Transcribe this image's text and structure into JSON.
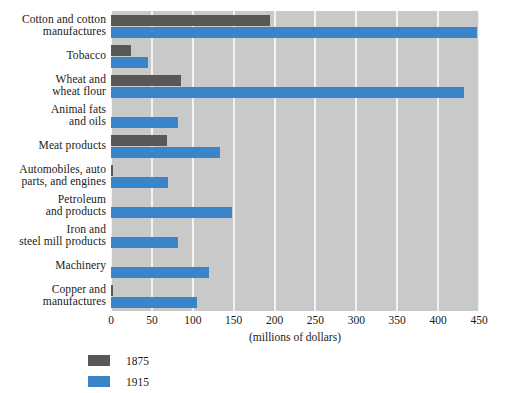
{
  "chart_data": {
    "type": "bar",
    "orientation": "horizontal",
    "title": "",
    "subtitle": "",
    "xlabel": "(millions of dollars)",
    "ylabel": "",
    "xlim": [
      0,
      450
    ],
    "xticks": [
      0,
      50,
      100,
      150,
      200,
      250,
      300,
      350,
      400,
      450
    ],
    "grid": "vertical-white-gridlines",
    "legend_position": "below-left",
    "categories": [
      "Cotton and cotton manufactures",
      "Tobacco",
      "Wheat and wheat flour",
      "Animal fats and oils",
      "Meat products",
      "Automobiles, auto parts, and engines",
      "Petroleum and products",
      "Iron and steel mill products",
      "Machinery",
      "Copper and manufactures"
    ],
    "category_lines": [
      [
        "Cotton and cotton",
        "manufactures"
      ],
      [
        "Tobacco"
      ],
      [
        "Wheat and",
        "wheat flour"
      ],
      [
        "Animal fats",
        "and oils"
      ],
      [
        "Meat products"
      ],
      [
        "Automobiles, auto",
        "parts, and engines"
      ],
      [
        "Petroleum",
        "and products"
      ],
      [
        "Iron and",
        "steel mill products"
      ],
      [
        "Machinery"
      ],
      [
        "Copper and",
        "manufactures"
      ]
    ],
    "series": [
      {
        "name": "1875",
        "color": "#585858",
        "values": [
          195,
          25,
          85,
          0,
          68,
          1,
          0,
          0,
          0,
          2
        ]
      },
      {
        "name": "1915",
        "color": "#3a85c8",
        "values": [
          448,
          45,
          432,
          82,
          133,
          70,
          148,
          82,
          120,
          105
        ]
      }
    ]
  },
  "legend": {
    "items": [
      {
        "label": "1875",
        "color": "#585858"
      },
      {
        "label": "1915",
        "color": "#3a85c8"
      }
    ]
  },
  "colors": {
    "plot_background": "#c9c9c9",
    "gridline": "#f2f2f2",
    "series_1875": "#585858",
    "series_1915": "#3a85c8",
    "text": "#1a1a1a",
    "page_background": "#ffffff"
  }
}
